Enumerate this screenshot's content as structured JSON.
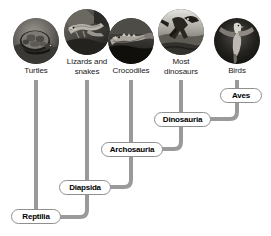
{
  "diagram": {
    "line_color": "#9a9a9a",
    "box_border_color": "#8f8f8f",
    "text_color": "#1a1a1a"
  },
  "taxa": [
    {
      "id": "turtles",
      "label": "Turtles",
      "icon": "turtle-photo",
      "x": 5,
      "y": 18,
      "stem_x": 36,
      "photo_y": 18
    },
    {
      "id": "squamates",
      "label": "Lizards and\nsnakes",
      "icon": "lizard-photo",
      "x": 56,
      "y": 9,
      "stem_x": 87,
      "photo_y": 9
    },
    {
      "id": "crocs",
      "label": "Crocodiles",
      "icon": "crocodile-photo",
      "x": 100,
      "y": 18,
      "stem_x": 131,
      "photo_y": 18
    },
    {
      "id": "dinosaurs",
      "label": "Most\ndinosaurs",
      "icon": "dinosaur-photo",
      "x": 150,
      "y": 9,
      "stem_x": 181,
      "photo_y": 9
    },
    {
      "id": "birds",
      "label": "Birds",
      "icon": "bird-photo",
      "x": 206,
      "y": 18,
      "stem_x": 237,
      "photo_y": 18
    }
  ],
  "taxa_labels": {
    "turtles": "Turtles",
    "squamates_line1": "Lizards and",
    "squamates_line2": "snakes",
    "crocodiles": "Crocodiles",
    "dinosaurs_line1": "Most",
    "dinosaurs_line2": "dinosaurs",
    "birds": "Birds"
  },
  "clades": [
    {
      "id": "aves",
      "label": "Aves",
      "x": 220,
      "y": 88,
      "w": 42
    },
    {
      "id": "dinosauria",
      "label": "Dinosauria",
      "x": 154,
      "y": 112,
      "w": 57
    },
    {
      "id": "archosauria",
      "label": "Archosauria",
      "x": 101,
      "y": 142,
      "w": 62
    },
    {
      "id": "diapsida",
      "label": "Diapsida",
      "x": 59,
      "y": 180,
      "w": 52
    },
    {
      "id": "reptilia",
      "label": "Reptilia",
      "x": 11,
      "y": 209,
      "w": 50
    }
  ]
}
